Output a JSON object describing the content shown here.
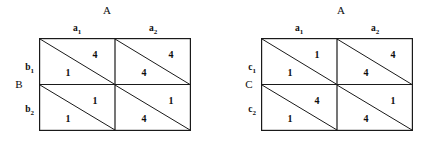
{
  "matrices": [
    {
      "id": "matrix-b",
      "column_player_title": "A",
      "row_player_title": "B",
      "column_headers": [
        "a",
        "a"
      ],
      "column_header_subs": [
        "1",
        "2"
      ],
      "row_headers": [
        "b",
        "b"
      ],
      "row_header_subs": [
        "1",
        "2"
      ],
      "cells": [
        {
          "row": 0,
          "col": 0,
          "upper_right": "4",
          "lower_left": "1"
        },
        {
          "row": 0,
          "col": 1,
          "upper_right": "4",
          "lower_left": "4"
        },
        {
          "row": 1,
          "col": 0,
          "upper_right": "1",
          "lower_left": "1"
        },
        {
          "row": 1,
          "col": 1,
          "upper_right": "1",
          "lower_left": "4"
        }
      ]
    },
    {
      "id": "matrix-c",
      "column_player_title": "A",
      "row_player_title": "C",
      "column_headers": [
        "a",
        "a"
      ],
      "column_header_subs": [
        "1",
        "2"
      ],
      "row_headers": [
        "c",
        "c"
      ],
      "row_header_subs": [
        "1",
        "2"
      ],
      "cells": [
        {
          "row": 0,
          "col": 0,
          "upper_right": "1",
          "lower_left": "1"
        },
        {
          "row": 0,
          "col": 1,
          "upper_right": "4",
          "lower_left": "4"
        },
        {
          "row": 1,
          "col": 0,
          "upper_right": "4",
          "lower_left": "1"
        },
        {
          "row": 1,
          "col": 1,
          "upper_right": "1",
          "lower_left": "4"
        }
      ]
    }
  ],
  "style": {
    "line_color": "#1a1a1a",
    "background": "#ffffff"
  }
}
